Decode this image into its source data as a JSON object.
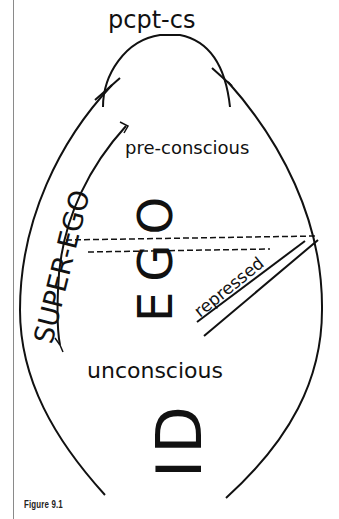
{
  "diagram": {
    "title_top": "pcpt-cs",
    "superego_label": "SUPER-EGO",
    "preconscious_label": "pre-conscious",
    "ego_label": "EGO",
    "repressed_label": "repressed",
    "unconscious_label": "unconscious",
    "id_label": "ID",
    "caption": "Figure 9.1",
    "colors": {
      "ink": "#111111",
      "background": "#ffffff",
      "rule": "#8a8a8a"
    }
  }
}
